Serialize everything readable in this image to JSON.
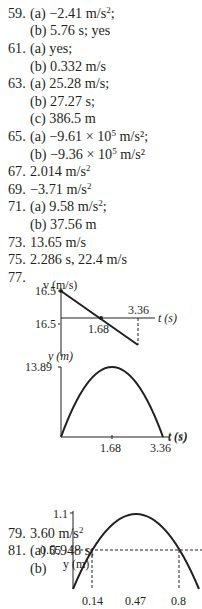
{
  "answers": [
    {
      "id": "a59",
      "num": "59.",
      "text": "(a) −2.41 m/s",
      "sup": "2",
      "tail": ";",
      "top": 5
    },
    {
      "id": "a59b",
      "num": "",
      "text": "(b) 5.76 s; yes",
      "sup": "",
      "tail": "",
      "top": 22
    },
    {
      "id": "a61",
      "num": "61.",
      "text": "(a) yes;",
      "sup": "",
      "tail": "",
      "top": 40
    },
    {
      "id": "a61b",
      "num": "",
      "text": "(b) 0.332 m/s",
      "sup": "",
      "tail": "",
      "top": 58
    },
    {
      "id": "a63",
      "num": "63.",
      "text": "(a) 25.28 m/s;",
      "sup": "",
      "tail": "",
      "top": 75
    },
    {
      "id": "a63b",
      "num": "",
      "text": "(b) 27.27 s;",
      "sup": "",
      "tail": "",
      "top": 93
    },
    {
      "id": "a63c",
      "num": "",
      "text": "(c) 386.5 m",
      "sup": "",
      "tail": "",
      "top": 110
    },
    {
      "id": "a65",
      "num": "65.",
      "text": "(a) −9.61 × 10",
      "sup": "5",
      "tail": " m/s²;",
      "top": 128
    },
    {
      "id": "a65b",
      "num": "",
      "text": "(b) −9.36 × 10",
      "sup": "5",
      "tail": " m/s²",
      "top": 146
    },
    {
      "id": "a67",
      "num": "67.",
      "text": "2.014 m/s",
      "sup": "2",
      "tail": "",
      "top": 163
    },
    {
      "id": "a69",
      "num": "69.",
      "text": "−3.71 m/s",
      "sup": "2",
      "tail": "",
      "top": 181
    },
    {
      "id": "a71",
      "num": "71.",
      "text": "(a) 9.58 m/s",
      "sup": "2",
      "tail": ";",
      "top": 198
    },
    {
      "id": "a71b",
      "num": "",
      "text": "(b) 37.56 m",
      "sup": "",
      "tail": "",
      "top": 216
    },
    {
      "id": "a73",
      "num": "73.",
      "text": "13.65 m/s",
      "sup": "",
      "tail": "",
      "top": 234
    },
    {
      "id": "a75",
      "num": "75.",
      "text": "2.286 s, 22.4 m/s",
      "sup": "",
      "tail": "",
      "top": 251
    },
    {
      "id": "a77",
      "num": "77.",
      "text": "",
      "sup": "",
      "tail": "",
      "top": 269
    },
    {
      "id": "a79",
      "num": "79.",
      "text": "3.60 m/s",
      "sup": "2",
      "tail": "",
      "top": 525
    },
    {
      "id": "a81",
      "num": "81.",
      "text": "(a) 0.948 s;",
      "sup": "",
      "tail": "",
      "top": 542
    },
    {
      "id": "a81b",
      "num": "",
      "text": "(b)",
      "sup": "",
      "tail": "",
      "top": 560
    }
  ],
  "chart_data": [
    {
      "type": "line",
      "title": "77 v-t graph",
      "xlabel": "t (s)",
      "ylabel": "v (m/s)",
      "x": [
        0,
        1.68,
        3.36
      ],
      "y": [
        16.5,
        0,
        -16.5
      ],
      "tick_labels": {
        "x": [
          "1.68",
          "3.36"
        ],
        "y": [
          "16.5",
          "16.5"
        ]
      }
    },
    {
      "type": "line",
      "title": "77 y-t graph",
      "xlabel": "t (s)",
      "ylabel": "y (m)",
      "x": [
        0,
        1.68,
        3.36
      ],
      "y": [
        0,
        13.89,
        0
      ],
      "tick_labels": {
        "x": [
          "1.68",
          "3.36"
        ],
        "y": [
          "13.89"
        ]
      }
    },
    {
      "type": "line",
      "title": "81(b) y-t graph",
      "xlabel": "",
      "ylabel": "y (m)",
      "x": [
        0,
        0.14,
        0.47,
        0.8,
        0.948
      ],
      "y": [
        0,
        0.55,
        1.1,
        0.55,
        0
      ],
      "tick_labels": {
        "x": [
          "0.14",
          "0.47",
          "0.8"
        ],
        "y": [
          "1.1",
          "0.55"
        ]
      }
    }
  ],
  "graph_labels": {
    "v_axis": "v (m/s)",
    "v_top": "16.5",
    "v_bottom": "16.5",
    "t_axis": "t (s)",
    "t_mid": "1.68",
    "t_end": "3.36",
    "y_axis": "y (m)",
    "y_top": "13.89",
    "g3_y_axis": "y (m)",
    "g3_y_top": "1.1",
    "g3_y_mid": "0.55",
    "g3_x1": "0.14",
    "g3_x2": "0.47",
    "g3_x3": "0.8"
  }
}
